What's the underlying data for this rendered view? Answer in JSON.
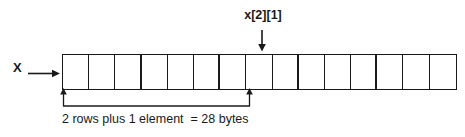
{
  "diagram": {
    "pointer": {
      "label": "X",
      "arrow_icon": "arrow-right-icon"
    },
    "annotation": {
      "label": "x[2][1]",
      "arrow_icon": "arrow-down-icon",
      "points_to_cell_index": 7
    },
    "measurement": {
      "caption": "2 rows plus 1 element  = 28 bytes",
      "rows": 2,
      "extra_elements": 1,
      "bytes": 28,
      "spans_cells": 7,
      "left_arrow_icon": "arrow-up-icon",
      "right_arrow_icon": "arrow-up-icon"
    },
    "array": {
      "total_cells": 15,
      "cells_per_row": 3,
      "rows": 5,
      "cells": [
        {
          "index": 0,
          "group_end": false
        },
        {
          "index": 1,
          "group_end": false
        },
        {
          "index": 2,
          "group_end": true
        },
        {
          "index": 3,
          "group_end": false
        },
        {
          "index": 4,
          "group_end": false
        },
        {
          "index": 5,
          "group_end": true
        },
        {
          "index": 6,
          "group_end": false
        },
        {
          "index": 7,
          "group_end": false
        },
        {
          "index": 8,
          "group_end": true
        },
        {
          "index": 9,
          "group_end": false
        },
        {
          "index": 10,
          "group_end": false
        },
        {
          "index": 11,
          "group_end": true
        },
        {
          "index": 12,
          "group_end": false
        },
        {
          "index": 13,
          "group_end": false
        },
        {
          "index": 14,
          "group_end": false
        }
      ]
    },
    "colors": {
      "ink": "#1a1a1a",
      "background": "#ffffff"
    }
  }
}
